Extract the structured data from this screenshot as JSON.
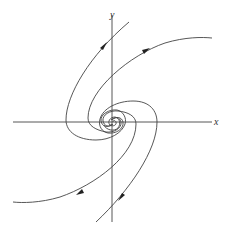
{
  "diagram": {
    "type": "phase-portrait",
    "axes": {
      "x_label": "x",
      "y_label": "y"
    },
    "trajectories": [
      {
        "name": "upper-left",
        "direction": "outward",
        "end_region": "upper, crossing y-axis"
      },
      {
        "name": "upper-right",
        "direction": "outward",
        "end_region": "upper right"
      },
      {
        "name": "lower-right",
        "direction": "outward",
        "end_region": "lower, crossing y-axis"
      },
      {
        "name": "lower-left",
        "direction": "outward",
        "end_region": "lower left"
      }
    ],
    "colors": {
      "line": "#444444",
      "background": "#ffffff"
    }
  }
}
